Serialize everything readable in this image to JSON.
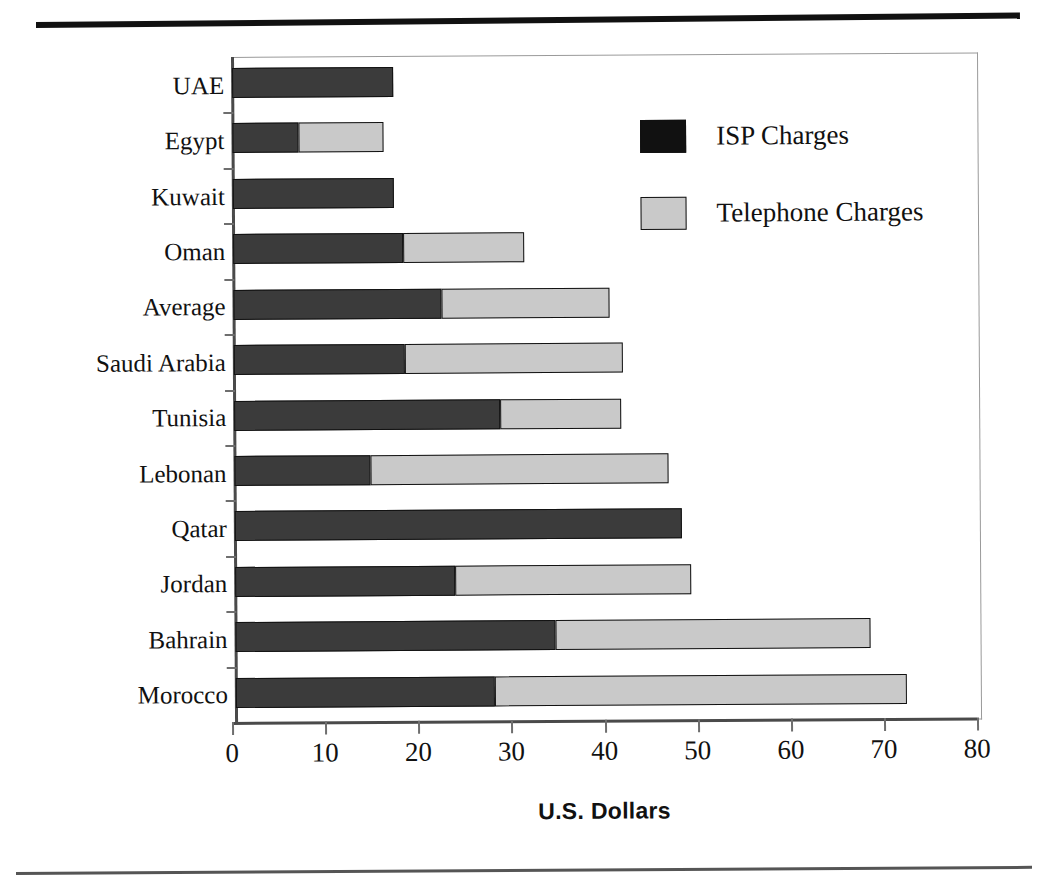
{
  "chart_data": {
    "type": "bar",
    "orientation": "horizontal",
    "stacked": true,
    "title": "",
    "xlabel": "U.S. Dollars",
    "ylabel": "",
    "xlim": [
      0,
      80
    ],
    "xticks": [
      0,
      10,
      20,
      30,
      40,
      50,
      60,
      70,
      80
    ],
    "grid": false,
    "legend_position": "upper right",
    "categories": [
      "UAE",
      "Egypt",
      "Kuwait",
      "Oman",
      "Average",
      "Saudi Arabia",
      "Tunisia",
      "Lebonan",
      "Qatar",
      "Jordan",
      "Bahrain",
      "Morocco"
    ],
    "series": [
      {
        "name": "ISP Charges",
        "color": "#3b3b3b",
        "values": [
          17.3,
          7.1,
          17.3,
          18.3,
          22.3,
          18.4,
          28.6,
          14.6,
          48.0,
          23.6,
          34.4,
          27.8
        ]
      },
      {
        "name": "Telephone Charges",
        "color": "#c9c9c9",
        "values": [
          0.0,
          9.1,
          0.0,
          13.0,
          18.1,
          23.4,
          13.0,
          32.0,
          0.0,
          25.4,
          33.8,
          44.3
        ]
      }
    ],
    "totals": [
      17.3,
      16.2,
      17.3,
      31.3,
      40.4,
      41.8,
      41.6,
      46.6,
      48.0,
      49.0,
      68.2,
      72.1
    ]
  },
  "legend": {
    "items": [
      {
        "label": "ISP Charges",
        "swatch": "dark-swatch-icon"
      },
      {
        "label": "Telephone Charges",
        "swatch": "light-swatch-icon"
      }
    ]
  },
  "axis": {
    "x_title": "U.S. Dollars",
    "x_tick_labels": [
      "0",
      "10",
      "20",
      "30",
      "40",
      "50",
      "60",
      "70",
      "80"
    ]
  },
  "colors": {
    "isp": "#3b3b3b",
    "telephone": "#c9c9c9",
    "axis": "#4a4a4a",
    "frame": "#9a9a9a",
    "text": "#111111"
  }
}
